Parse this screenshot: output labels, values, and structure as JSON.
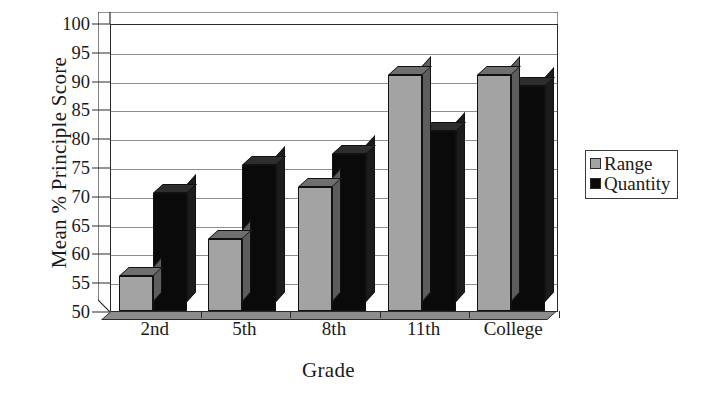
{
  "chart_data": {
    "type": "bar",
    "title": "",
    "xlabel": "Grade",
    "ylabel": "Mean % Principle Score",
    "categories": [
      "2nd",
      "5th",
      "8th",
      "11th",
      "College"
    ],
    "series": [
      {
        "name": "Range",
        "color": "#a3a3a3",
        "values": [
          56,
          62.5,
          71.5,
          91,
          91
        ]
      },
      {
        "name": "Quantity",
        "color": "#0a0a0a",
        "values": [
          70.5,
          75.3,
          77.3,
          81.3,
          89
        ]
      }
    ],
    "ylim": [
      50,
      100
    ],
    "ytick_step": 5,
    "yticks": [
      50,
      55,
      60,
      65,
      70,
      75,
      80,
      85,
      90,
      95,
      100
    ],
    "ytick_labels": [
      "50",
      "55",
      "60",
      "65",
      "70",
      "75",
      "80",
      "85",
      "90",
      "95",
      "100"
    ],
    "grid": true,
    "grid_axis": "y",
    "legend_position": "right",
    "style": "3d-column"
  },
  "axes": {
    "y_title": "Mean % Principle Score",
    "x_title": "Grade"
  },
  "legend": {
    "entries": [
      {
        "label": "Range"
      },
      {
        "label": "Quantity"
      }
    ]
  }
}
